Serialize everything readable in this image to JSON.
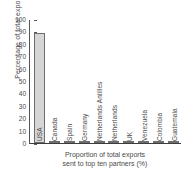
{
  "chart_data": {
    "type": "bar",
    "title": "",
    "subtitle": "",
    "xlabel_line1": "Proportion of total exports",
    "xlabel_line2": "sent to top ten partners (%)",
    "ylabel": "Percentage of total exports",
    "categories": [
      "USA",
      "Canada",
      "Spain",
      "Germany",
      "Netherlands Antilles",
      "Netherlands",
      "UK",
      "Venezuela",
      "Colombia",
      "Guatemala"
    ],
    "values": [
      89,
      2,
      2,
      1,
      1,
      1,
      1,
      1,
      1,
      1
    ],
    "ylim": [
      0,
      100
    ],
    "ytick_labels": [
      "0",
      "10",
      "20",
      "30",
      "40",
      "50",
      "60",
      "70",
      "80",
      "90",
      "100"
    ],
    "ytick_values": [
      0,
      10,
      20,
      30,
      40,
      50,
      60,
      70,
      80,
      90,
      100
    ],
    "grid": false,
    "legend": false,
    "legend_position": "none",
    "bar_fill_color": "#d6d6d6",
    "bar_edge_color": "#6d6d6d",
    "axis_color": "#3c3c3c",
    "text_color": "#4a4a4a"
  }
}
